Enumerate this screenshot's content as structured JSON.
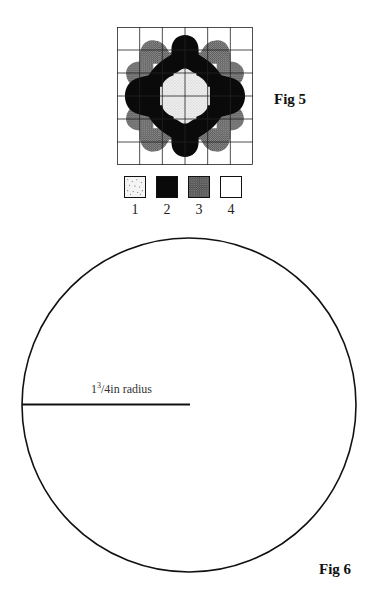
{
  "figures": [
    {
      "id": "fig5",
      "label": "Fig 5",
      "description": "6x6 grid quilt/appliqué pattern with scalloped shapes",
      "grid": {
        "rows": 6,
        "cols": 6
      },
      "legend": [
        {
          "number": "1",
          "fill": "light-dotted",
          "color": "#e6e6e6"
        },
        {
          "number": "2",
          "fill": "solid-black",
          "color": "#0a0a0a"
        },
        {
          "number": "3",
          "fill": "dense-dotted",
          "color": "#7a7a7a"
        },
        {
          "number": "4",
          "fill": "white",
          "color": "#ffffff"
        }
      ]
    },
    {
      "id": "fig6",
      "label": "Fig 6",
      "description": "Circle template",
      "radius_label": {
        "whole": "1",
        "numerator": "3",
        "denominator": "4in radius"
      }
    }
  ],
  "colors": {
    "ink": "#111111",
    "background": "#ffffff"
  }
}
